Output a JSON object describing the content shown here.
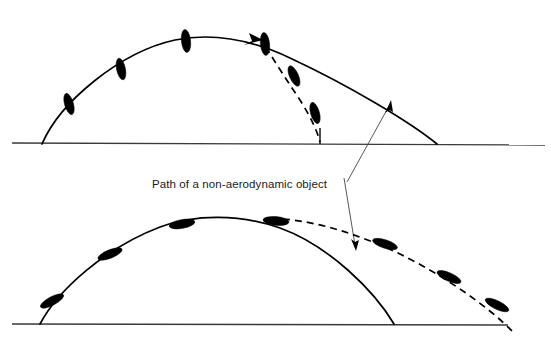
{
  "diagram": {
    "background_color": "#ffffff",
    "ink_color": "#000000",
    "ground_color": "#3a3a3a",
    "leader_color": "#444444",
    "width": 551,
    "height": 338
  },
  "annotation": {
    "label": "Path of a non-aerodynamic object",
    "label_x": 152,
    "label_y": 184,
    "leader_origin": {
      "x": 347,
      "y": 180
    },
    "leader_upper_tip": {
      "x": 388,
      "y": 104
    },
    "leader_lower_tip": {
      "x": 355,
      "y": 248
    }
  },
  "panels": [
    {
      "name": "upper-panel",
      "description": "Non-aerodynamic object: tumbling, steep vertical attitude, falls short",
      "ground": {
        "x1": 12,
        "y1": 143,
        "x2": 545,
        "y2": 145
      },
      "launch": {
        "x": 42,
        "y": 144
      },
      "apex": {
        "x": 215,
        "y": 36
      },
      "solid_landing": {
        "x": 437,
        "y": 144
      },
      "branch_point": {
        "x": 263,
        "y": 43
      },
      "dashed_landing": {
        "x": 320,
        "y": 142
      },
      "object_angle_deg": 78,
      "object_rx": 11,
      "object_ry": 4.4,
      "objects": [
        {
          "x": 69,
          "y": 104,
          "angle": 74
        },
        {
          "x": 121,
          "y": 69,
          "angle": 78
        },
        {
          "x": 186,
          "y": 41,
          "angle": 84
        },
        {
          "x": 265,
          "y": 44,
          "angle": 84
        },
        {
          "x": 294,
          "y": 76,
          "angle": 66
        },
        {
          "x": 315,
          "y": 113,
          "angle": 74
        }
      ],
      "drop_tick": {
        "x": 320,
        "y1": 128,
        "y2": 144
      }
    },
    {
      "name": "lower-panel",
      "description": "Aerodynamic object: aligned with flight path, glides far beyond",
      "ground": {
        "x1": 12,
        "y1": 324,
        "x2": 508,
        "y2": 325
      },
      "launch": {
        "x": 40,
        "y": 324
      },
      "apex": {
        "x": 225,
        "y": 218
      },
      "solid_landing": {
        "x": 394,
        "y": 324
      },
      "branch_point": {
        "x": 292,
        "y": 220
      },
      "dashed_landing": {
        "x": 513,
        "y": 332
      },
      "object_angle_deg": 8,
      "object_rx": 13,
      "object_ry": 4.2,
      "objects": [
        {
          "x": 52,
          "y": 301,
          "angle": -28
        },
        {
          "x": 110,
          "y": 254,
          "angle": -22
        },
        {
          "x": 182,
          "y": 224,
          "angle": -10
        },
        {
          "x": 276,
          "y": 221,
          "angle": 5
        },
        {
          "x": 385,
          "y": 244,
          "angle": 18
        },
        {
          "x": 449,
          "y": 277,
          "angle": 24
        },
        {
          "x": 497,
          "y": 305,
          "angle": 26
        }
      ]
    }
  ]
}
